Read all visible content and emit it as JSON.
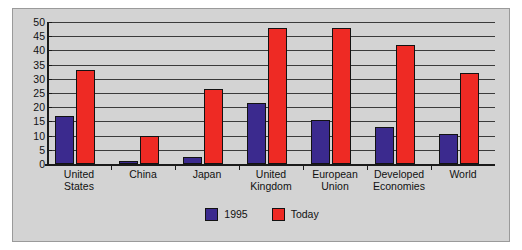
{
  "chart_data": {
    "type": "bar",
    "title": "",
    "subtitle": "",
    "xlabel": "",
    "ylabel": "",
    "ylim": [
      0,
      50
    ],
    "ytick_labels": [
      "50",
      "45",
      "40",
      "35",
      "30",
      "25",
      "20",
      "15",
      "10",
      "5",
      "0"
    ],
    "ytick_values": [
      50,
      45,
      40,
      35,
      30,
      25,
      20,
      15,
      10,
      5,
      0
    ],
    "grid": true,
    "legend_position": "bottom-center",
    "categories": [
      "United\nStates",
      "China",
      "Japan",
      "United\nKingdom",
      "European\nUnion",
      "Developed\nEconomies",
      "World"
    ],
    "series": [
      {
        "name": "1995",
        "color": "#3B2A8E",
        "values": [
          17,
          1,
          2.5,
          21.5,
          15.5,
          13,
          10.5
        ]
      },
      {
        "name": "Today",
        "color": "#EE2A24",
        "values": [
          33,
          10,
          26.5,
          48,
          48,
          42,
          32
        ]
      }
    ]
  },
  "figure": {
    "background_color": "#D3D3D3",
    "border_color": "#9A9A9A",
    "axis_color": "#1A1A1A",
    "gridline_color": "#3A3A3A"
  }
}
